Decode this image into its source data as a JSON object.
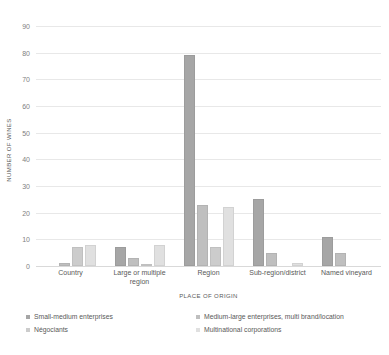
{
  "chart_data": {
    "type": "bar",
    "title": "",
    "xlabel": "PLACE OF ORIGIN",
    "ylabel": "NUMBER OF WINES",
    "ylim": [
      0,
      90
    ],
    "ytick_labels": [
      "90",
      "80",
      "70",
      "60",
      "50",
      "40",
      "30",
      "20",
      "10",
      "0"
    ],
    "yticks": [
      90,
      80,
      70,
      60,
      50,
      40,
      30,
      20,
      10,
      0
    ],
    "grid": true,
    "legend_position": "bottom",
    "categories": [
      "Country",
      "Large or multiple region",
      "Region",
      "Sub-region/district",
      "Named vineyard"
    ],
    "series": [
      {
        "name": "Small-medium enterprises",
        "color": "#a6a6a6",
        "values": [
          0,
          7,
          79,
          25,
          11
        ]
      },
      {
        "name": "Medium-large enterprises, multi brand/location",
        "color": "#bfbfbf",
        "values": [
          1,
          3,
          23,
          5,
          5
        ]
      },
      {
        "name": "Négociants",
        "color": "#cccccc",
        "values": [
          7,
          0.5,
          7,
          0,
          0
        ]
      },
      {
        "name": "Multinational corporations",
        "color": "#e0e0e0",
        "values": [
          8,
          8,
          22,
          1,
          0
        ]
      }
    ]
  },
  "legend": {
    "items": [
      {
        "label": "Small-medium enterprises",
        "color": "#a6a6a6"
      },
      {
        "label": "Medium-large enterprises, multi brand/location",
        "color": "#bfbfbf"
      },
      {
        "label": "Négociants",
        "color": "#cccccc"
      },
      {
        "label": "Multinational corporations",
        "color": "#e0e0e0"
      }
    ]
  }
}
